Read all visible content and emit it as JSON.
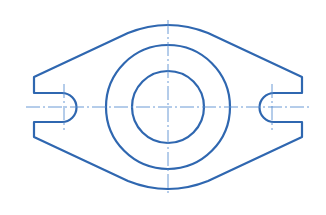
{
  "drawing": {
    "type": "flange-top-view",
    "stroke_color": "#2f67b0",
    "centerline_color": "#5a8fd0",
    "background": "#ffffff",
    "center": [
      168,
      107
    ],
    "outer_bore_radius": 62,
    "inner_bore_radius": 36,
    "slots": [
      "left",
      "right"
    ]
  }
}
